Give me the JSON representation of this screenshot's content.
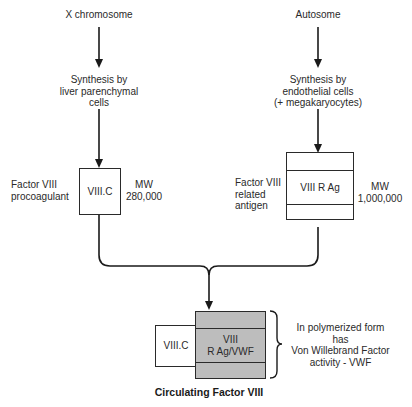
{
  "left_branch": {
    "origin": "X chromosome",
    "synthesis": [
      "Synthesis by",
      "liver parenchymal",
      "cells"
    ],
    "factor_label": [
      "Factor VIII",
      "procoagulant"
    ],
    "box_label": "VIII.C",
    "mw_label": "MW",
    "mw_value": "280,000"
  },
  "right_branch": {
    "origin": "Autosome",
    "synthesis": [
      "Synthesis by",
      "endothelial cells",
      "(+ megakaryocytes)"
    ],
    "factor_label": [
      "Factor VIII",
      "related",
      "antigen"
    ],
    "box_label": "VIII R Ag",
    "mw_label": "MW",
    "mw_value": "1,000,000"
  },
  "result": {
    "small_box_label": "VIII.C",
    "gray_box_label": [
      "VIII",
      "R Ag/VWF"
    ],
    "brace_note": [
      "In polymerized form",
      "has",
      "Von Willebrand Factor",
      "activity - VWF"
    ],
    "caption": "Circulating Factor VIII",
    "gray_fill": "#bdbdbd"
  }
}
